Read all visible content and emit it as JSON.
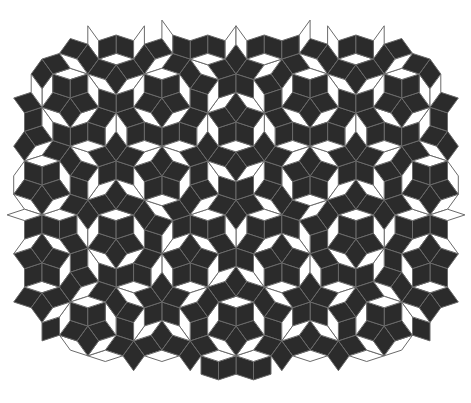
{
  "figure": {
    "colors": {
      "background": "#ffffff",
      "light_tile": "#ffffff",
      "dark_tile": "#2b2b2b",
      "edge": "#6a6a6a"
    },
    "tiling": {
      "center": [
        236,
        200
      ],
      "radius": 330,
      "generations": 6,
      "bounds": {
        "left": 18,
        "top": 36,
        "right": 452,
        "bottom": 372
      }
    }
  }
}
